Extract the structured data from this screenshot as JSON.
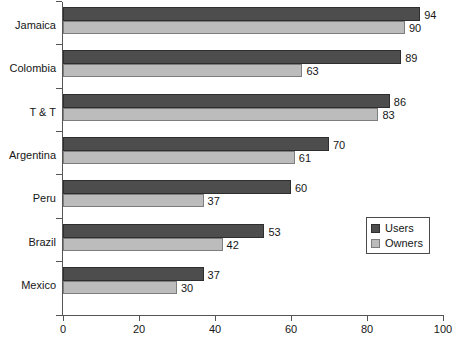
{
  "chart_data": {
    "type": "bar",
    "orientation": "horizontal",
    "title": "",
    "subtitle": "",
    "xlabel": "",
    "ylabel": "",
    "xlim": [
      0,
      100
    ],
    "xticks": [
      0,
      20,
      40,
      60,
      80,
      100
    ],
    "xtick_labels": [
      "0",
      "20",
      "40",
      "60",
      "80",
      "100"
    ],
    "grid": false,
    "legend_position": "inside-right-lower",
    "categories": [
      "Jamaica",
      "Colombia",
      "T & T",
      "Argentina",
      "Peru",
      "Brazil",
      "Mexico"
    ],
    "series": [
      {
        "name": "Users",
        "color": "#4d4d4d",
        "values": [
          94,
          89,
          86,
          70,
          60,
          53,
          37
        ],
        "value_labels": [
          "94",
          "89",
          "86",
          "70",
          "60",
          "53",
          "37"
        ]
      },
      {
        "name": "Owners",
        "color": "#bcbcbc",
        "values": [
          90,
          63,
          83,
          61,
          37,
          42,
          30
        ],
        "value_labels": [
          "90",
          "63",
          "83",
          "61",
          "37",
          "42",
          "30"
        ]
      }
    ]
  },
  "legend": {
    "items": [
      {
        "label": "Users",
        "color": "#4d4d4d"
      },
      {
        "label": "Owners",
        "color": "#bcbcbc"
      }
    ]
  },
  "axis": {
    "x_tick_labels": [
      "0",
      "20",
      "40",
      "60",
      "80",
      "100"
    ],
    "y_category_labels": [
      "Jamaica",
      "Colombia",
      "T & T",
      "Argentina",
      "Peru",
      "Brazil",
      "Mexico"
    ]
  },
  "colors": {
    "users_bar": "#4d4d4d",
    "owners_bar": "#bcbcbc",
    "axis": "#555555",
    "text": "#161616",
    "background": "#ffffff"
  }
}
